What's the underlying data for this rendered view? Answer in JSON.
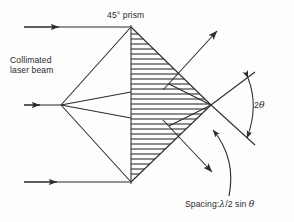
{
  "figure": {
    "type": "optical-ray-diagram",
    "background_color": "#fdfdfd",
    "ink_color": "#2b2b2b"
  },
  "labels": {
    "prism": "45° prism",
    "beam_line1": "Collimated",
    "beam_line2": "laser beam",
    "angle": "2",
    "angle_symbol": "θ",
    "spacing_prefix": "Spacing:",
    "spacing_lambda": "λ",
    "spacing_mid": "/2 sin ",
    "spacing_theta": "θ",
    "spacing_full": "Spacing:λ/2 sin θ"
  },
  "geometry": {
    "prism_top_apex": [
      131,
      27
    ],
    "prism_bottom_apex": [
      131,
      182
    ],
    "converge_point": [
      61,
      105
    ],
    "diamond_right_vertex": [
      211,
      105
    ],
    "diamond_left_vertex": [
      131,
      105
    ],
    "vertical_face_x": 131,
    "input_beam_top_y": 27,
    "input_beam_mid_y": 105,
    "input_beam_bottom_y": 182,
    "input_beam_start_x": 24,
    "hatch_spacing_px": 5
  },
  "elements": {
    "input_ray_top": "horizontal input ray with arrowhead entering top apex",
    "input_ray_middle": "horizontal input ray with arrowhead entering convergence point",
    "input_ray_bottom": "horizontal input ray with arrowhead entering bottom apex",
    "converging_rays": "three rays fanning from convergence point to prism faces",
    "output_ray_upper": "diffracted output ray to upper right with arrowhead",
    "output_ray_lower": "diffracted output ray to lower right with arrowhead",
    "angle_arc": "double-headed arc spanning the two output rays",
    "hatched_region": "horizontally hatched rhombus representing acoustic wavefronts",
    "leader_curve": "curved leader line from spacing label to hatched region"
  }
}
